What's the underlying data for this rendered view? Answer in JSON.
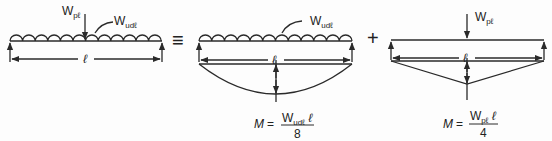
{
  "diagram": {
    "type": "beam-superposition",
    "colors": {
      "line": "#2a2a2a",
      "background": "#fdfdfd"
    },
    "panel1": {
      "point_load": {
        "symbol": "W",
        "subscript": "pℓ"
      },
      "udl_load": {
        "symbol": "W",
        "subscript": "udℓ"
      },
      "span_label": "ℓ"
    },
    "equivalence_symbol": "≡",
    "panel2": {
      "udl_load": {
        "symbol": "W",
        "subscript": "udℓ"
      },
      "span_label": "ℓ",
      "moment_diagram": "parabolic",
      "formula": {
        "lhs": "M =",
        "numerator_symbol": "W",
        "numerator_subscript": "udℓ",
        "numerator_tail": " ℓ",
        "denominator": "8"
      }
    },
    "plus_symbol": "+",
    "panel3": {
      "point_load": {
        "symbol": "W",
        "subscript": "pℓ"
      },
      "span_label": "ℓ",
      "moment_diagram": "triangular",
      "formula": {
        "lhs": "M =",
        "numerator_symbol": "W",
        "numerator_subscript": "pℓ",
        "numerator_tail": " ℓ",
        "denominator": "4"
      }
    }
  }
}
